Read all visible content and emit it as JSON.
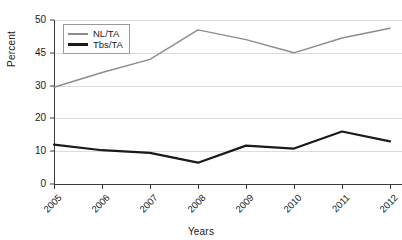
{
  "chart_data": {
    "type": "line",
    "title": "",
    "xlabel": "Years",
    "ylabel": "Percent",
    "categories": [
      "2005",
      "2006",
      "2007",
      "2008",
      "2009",
      "2010",
      "2011",
      "2012"
    ],
    "ytick_labels": [
      "50",
      "45",
      "30",
      "20",
      "10",
      "0"
    ],
    "ylim": [
      0,
      50
    ],
    "grid": true,
    "legend_position": "top-left",
    "series": [
      {
        "name": "NL/TA",
        "color": "#8c8c8c",
        "values": [
          29.5,
          34.0,
          38.0,
          47.0,
          44.0,
          40.0,
          44.5,
          47.5
        ]
      },
      {
        "name": "Tbs/TA",
        "color": "#1a1a1a",
        "values": [
          12.0,
          10.3,
          9.5,
          6.5,
          11.7,
          10.8,
          16.0,
          13.0
        ]
      }
    ]
  },
  "axes": {
    "y_title": "Percent",
    "x_title": "Years"
  },
  "legend": {
    "items": [
      {
        "label": "NL/TA"
      },
      {
        "label": "Tbs/TA"
      }
    ]
  }
}
